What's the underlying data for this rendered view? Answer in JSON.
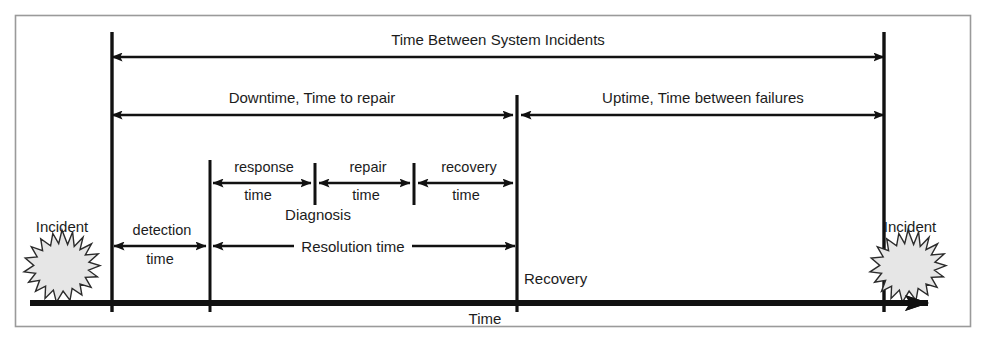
{
  "diagram": {
    "type": "timeline-diagram",
    "frame": {
      "border_color": "#9a9a9a",
      "background": "#ffffff"
    },
    "colors": {
      "line": "#111111",
      "text": "#1c1c1c",
      "star_fill": "#e6e6e6",
      "star_stroke": "#2b2b2b",
      "frame": "#9a9a9a"
    },
    "axis": {
      "label": "Time",
      "description": "horizontal time axis with arrowhead pointing right"
    },
    "markers": [
      {
        "name": "incident-start",
        "label": "Incident",
        "x": 112
      },
      {
        "name": "detection-point",
        "label": "",
        "x": 210
      },
      {
        "name": "diagnosis-point",
        "label": "Diagnosis",
        "x": 315
      },
      {
        "name": "repair-end-point",
        "label": "",
        "x": 414
      },
      {
        "name": "recovery-point",
        "label": "Recovery",
        "x": 517
      },
      {
        "name": "incident-end",
        "label": "Incident",
        "x": 884
      }
    ],
    "spans": [
      {
        "name": "time-between-system-incidents",
        "label": "Time Between System Incidents",
        "from": 112,
        "to": 884,
        "row_y": 57,
        "label_y": 42,
        "arrows": "both"
      },
      {
        "name": "downtime",
        "label": "Downtime, Time to repair",
        "from": 112,
        "to": 513,
        "row_y": 115,
        "label_y": 100,
        "arrows": "both"
      },
      {
        "name": "uptime",
        "label": "Uptime, Time between failures",
        "from": 521,
        "to": 884,
        "row_y": 115,
        "label_y": 100,
        "arrows": "both"
      },
      {
        "name": "response-time",
        "label_top": "response",
        "label_bottom": "time",
        "from": 213,
        "to": 311,
        "row_y": 183,
        "arrows": "both"
      },
      {
        "name": "repair-time",
        "label_top": "repair",
        "label_bottom": "time",
        "from": 319,
        "to": 410,
        "row_y": 183,
        "arrows": "both"
      },
      {
        "name": "recovery-time",
        "label_top": "recovery",
        "label_bottom": "time",
        "from": 418,
        "to": 513,
        "row_y": 183,
        "arrows": "both"
      },
      {
        "name": "detection-time",
        "label_top": "detection",
        "label_bottom": "time",
        "from": 114,
        "to": 206,
        "row_y": 246,
        "arrows": "both"
      },
      {
        "name": "resolution-time",
        "label": "Resolution time",
        "from": 213,
        "to": 515,
        "row_y": 246,
        "arrows": "both"
      }
    ],
    "labels": {
      "time_between_system_incidents": "Time Between System Incidents",
      "downtime": "Downtime, Time to repair",
      "uptime": "Uptime, Time between failures",
      "response": "response",
      "response_time": "time",
      "repair": "repair",
      "repair_time": "time",
      "recovery": "recovery",
      "recovery_time": "time",
      "diagnosis": "Diagnosis",
      "detection": "detection",
      "detection_time": "time",
      "resolution_time": "Resolution time",
      "recovery_point": "Recovery",
      "incident_left": "Incident",
      "incident_right": "Incident",
      "time_axis": "Time"
    }
  }
}
